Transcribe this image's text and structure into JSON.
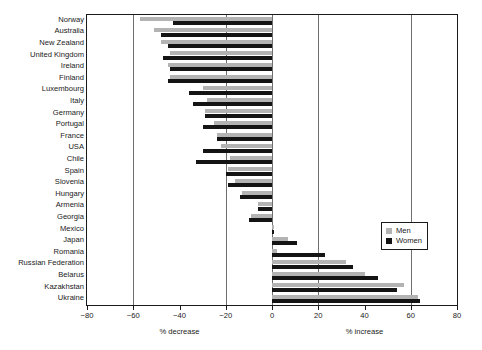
{
  "legend": {
    "position": "inside-right",
    "entries": [
      {
        "label": "Men",
        "color": "#b3b3b3"
      },
      {
        "label": "Women",
        "color": "#141414"
      }
    ]
  },
  "axis": {
    "left_title": "% decrease",
    "right_title": "% increase",
    "ticks": [
      "−80",
      "−60",
      "−40",
      "−20",
      "0",
      "20",
      "40",
      "60",
      "80"
    ],
    "tick_values": [
      -80,
      -60,
      -40,
      -20,
      0,
      20,
      40,
      60,
      80
    ],
    "gridlines": [
      -60,
      -20,
      20,
      60
    ]
  },
  "chart_data": {
    "type": "bar",
    "orientation": "horizontal",
    "title": "",
    "xlabel": "% decrease / % increase",
    "ylabel": "",
    "xlim": [
      -80,
      80
    ],
    "grid": true,
    "legend_position": "inside-right",
    "categories": [
      "Norway",
      "Australia",
      "New Zealand",
      "United Kingdom",
      "Ireland",
      "Finland",
      "Luxembourg",
      "Italy",
      "Germany",
      "Portugal",
      "France",
      "USA",
      "Chile",
      "Spain",
      "Slovenia",
      "Hungary",
      "Armenia",
      "Georgia",
      "Mexico",
      "Japan",
      "Romania",
      "Russian Federation",
      "Belarus",
      "Kazakhstan",
      "Ukraine"
    ],
    "series": [
      {
        "name": "Men",
        "color": "#b3b3b3",
        "values": [
          -57,
          -51,
          -48,
          -44,
          -45,
          -44,
          -30,
          -28,
          -29,
          -25,
          -24,
          -22,
          -18,
          -19,
          -16,
          -13,
          -6,
          -9,
          1,
          7,
          2,
          32,
          40,
          57,
          63
        ]
      },
      {
        "name": "Women",
        "color": "#141414",
        "values": [
          -43,
          -48,
          -45,
          -47,
          -44,
          -45,
          -36,
          -34,
          -29,
          -30,
          -24,
          -30,
          -33,
          -20,
          -19,
          -14,
          -6,
          -10,
          1,
          11,
          23,
          35,
          46,
          54,
          64
        ]
      }
    ]
  }
}
